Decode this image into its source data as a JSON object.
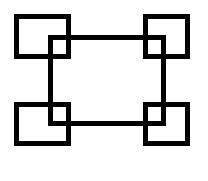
{
  "diagram": {
    "stroke_color": "#000000",
    "background": "#ffffff",
    "stroke_width": 5,
    "shapes": [
      {
        "name": "center-rectangle",
        "x": 48,
        "y": 35,
        "w": 118,
        "h": 91
      },
      {
        "name": "corner-square-top-left",
        "x": 14,
        "y": 14,
        "w": 57,
        "h": 45
      },
      {
        "name": "corner-square-top-right",
        "x": 143,
        "y": 14,
        "w": 47,
        "h": 45
      },
      {
        "name": "corner-square-bottom-left",
        "x": 14,
        "y": 102,
        "w": 57,
        "h": 44
      },
      {
        "name": "corner-square-bottom-right",
        "x": 143,
        "y": 102,
        "w": 47,
        "h": 44
      }
    ]
  }
}
